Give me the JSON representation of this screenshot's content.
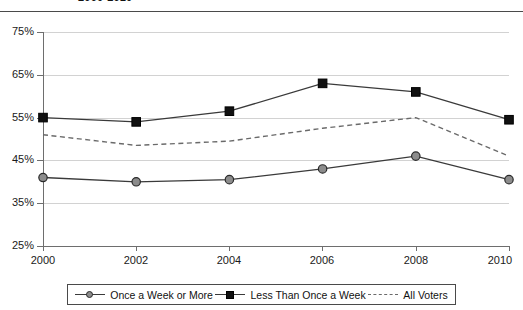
{
  "chart_title": "2000-2010",
  "legend": {
    "items": [
      {
        "label": "Once a Week or More",
        "marker": "circle-marker-icon",
        "style": "solid"
      },
      {
        "label": "Less Than Once a Week",
        "marker": "square-marker-icon",
        "style": "solid"
      },
      {
        "label": "All Voters",
        "marker": "dashed-line-icon",
        "style": "dashed"
      }
    ]
  },
  "colors": {
    "axis": "#6e6e6e",
    "grid": "#d2d2d2",
    "series_circle": "#8c8c8c",
    "series_square": "#111111",
    "series_dashed": "#6a6a6a",
    "text": "#1a1a1a"
  },
  "axis": {
    "y_ticks": [
      "25%",
      "35%",
      "45%",
      "55%",
      "65%",
      "75%"
    ],
    "x_ticks": [
      "2000",
      "2002",
      "2004",
      "2006",
      "2008",
      "2010"
    ]
  },
  "chart_data": {
    "type": "line",
    "title": "2000-2010",
    "xlabel": "",
    "ylabel": "",
    "x": [
      2000,
      2002,
      2004,
      2006,
      2008,
      2010
    ],
    "categories": [
      "2000",
      "2002",
      "2004",
      "2006",
      "2008",
      "2010"
    ],
    "ylim": [
      25,
      75
    ],
    "ytick_values": [
      25,
      35,
      45,
      55,
      65,
      75
    ],
    "ytick_labels": [
      "25%",
      "35%",
      "45%",
      "55%",
      "65%",
      "75%"
    ],
    "xlim": [
      2000,
      2010
    ],
    "grid": "horizontal",
    "legend_position": "bottom",
    "series": [
      {
        "name": "Once a Week or More",
        "marker": "circle",
        "linestyle": "solid",
        "color": "#8c8c8c",
        "values": [
          41,
          40,
          40.5,
          43,
          46,
          40.5
        ]
      },
      {
        "name": "Less Than Once a Week",
        "marker": "square",
        "linestyle": "solid",
        "color": "#111111",
        "values": [
          55,
          54,
          56.5,
          63,
          61,
          54.5
        ]
      },
      {
        "name": "All Voters",
        "marker": "none",
        "linestyle": "dashed",
        "color": "#6a6a6a",
        "values": [
          51,
          48.5,
          49.5,
          52.5,
          55,
          46
        ]
      }
    ]
  }
}
